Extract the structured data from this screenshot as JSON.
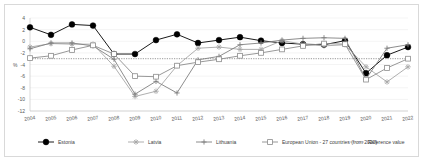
{
  "chart": {
    "type": "line",
    "title": "",
    "xlabel": "",
    "ylabel": "%",
    "ylim": [
      -12,
      4
    ],
    "ytick_values": [
      4,
      2,
      0,
      -2,
      -4,
      -6,
      -8,
      -10,
      -12
    ],
    "ytick_labels": [
      "4",
      "2",
      "0",
      "-2",
      "-4",
      "-6",
      "-8",
      "-10",
      "-12"
    ],
    "grid": true,
    "legend_position": "bottom"
  },
  "chart_data": {
    "type": "line",
    "title": "",
    "xlabel": "",
    "ylabel": "%",
    "ylim": [
      -12,
      4
    ],
    "grid": true,
    "legend_position": "bottom",
    "categories": [
      "2004",
      "2005",
      "2006",
      "2007",
      "2008",
      "2009",
      "2010",
      "2011",
      "2012",
      "2013",
      "2014",
      "2015",
      "2016",
      "2017",
      "2018",
      "2019",
      "2020",
      "2021",
      "2022"
    ],
    "series": [
      {
        "name": "Estonia",
        "marker": "filled-circle",
        "color": "#000000",
        "values": [
          2.4,
          1.1,
          2.9,
          2.7,
          -2.2,
          -2.2,
          0.2,
          1.2,
          -0.3,
          0.2,
          0.7,
          0.1,
          -0.3,
          -0.5,
          -0.6,
          0.1,
          -5.5,
          -2.4,
          -1.0
        ]
      },
      {
        "name": "Latvia",
        "marker": "star",
        "color": "#a6a6a6",
        "values": [
          -1.0,
          -0.4,
          -0.5,
          -0.5,
          -4.3,
          -9.5,
          -8.6,
          -4.2,
          -1.2,
          -1.0,
          -1.4,
          -1.4,
          0.1,
          -0.5,
          -0.8,
          -0.6,
          -4.4,
          -7.0,
          -4.4
        ]
      },
      {
        "name": "Lithuania",
        "marker": "plus",
        "color": "#808080",
        "values": [
          -1.3,
          -0.3,
          -0.3,
          -0.8,
          -3.1,
          -9.1,
          -6.9,
          -8.9,
          -3.2,
          -2.6,
          -0.6,
          -0.3,
          0.2,
          0.5,
          0.6,
          0.5,
          -6.5,
          -1.2,
          -0.6
        ]
      },
      {
        "name": "European Union - 27 countries (from 2020)",
        "marker": "open-square",
        "color": "#8c8c8c",
        "values": [
          -2.9,
          -2.5,
          -1.5,
          -0.7,
          -2.2,
          -6.0,
          -6.1,
          -4.2,
          -3.6,
          -3.1,
          -2.5,
          -2.0,
          -1.4,
          -0.8,
          -0.4,
          -0.5,
          -6.6,
          -4.6,
          -3.0
        ]
      }
    ],
    "reference_line": {
      "name": "Reference value",
      "value": -3,
      "style": "dotted",
      "color": "#7f7f7f"
    }
  },
  "legend": {
    "items": [
      {
        "label": "Estonia",
        "marker": "filled-circle"
      },
      {
        "label": "Latvia",
        "marker": "star"
      },
      {
        "label": "Lithuania",
        "marker": "plus"
      },
      {
        "label": "European Union - 27 countries (from 2020)",
        "marker": "open-square"
      },
      {
        "label": "Reference value",
        "marker": "dotted-line"
      }
    ]
  }
}
